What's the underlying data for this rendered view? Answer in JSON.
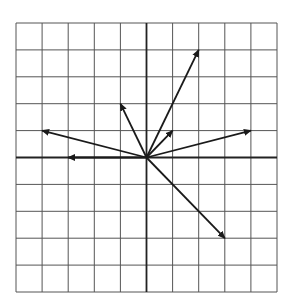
{
  "diagram": {
    "type": "vector-grid",
    "grid": {
      "x_min": -5,
      "x_max": 5,
      "y_min": -5,
      "y_max": 5,
      "step": 1,
      "line_color": "#555555",
      "axis_color": "#222222"
    },
    "origin": [
      0,
      0
    ],
    "vectors": [
      {
        "id": "v1",
        "from": [
          0,
          0
        ],
        "to": [
          2,
          4
        ]
      },
      {
        "id": "v2",
        "from": [
          0,
          0
        ],
        "to": [
          -1,
          2
        ]
      },
      {
        "id": "v3",
        "from": [
          0,
          0
        ],
        "to": [
          1,
          1
        ]
      },
      {
        "id": "v4",
        "from": [
          0,
          0
        ],
        "to": [
          4,
          1
        ]
      },
      {
        "id": "v5",
        "from": [
          0,
          0
        ],
        "to": [
          -4,
          1
        ]
      },
      {
        "id": "v6",
        "from": [
          0,
          0
        ],
        "to": [
          -3,
          0
        ]
      },
      {
        "id": "v7",
        "from": [
          0,
          0
        ],
        "to": [
          3,
          -3
        ]
      }
    ],
    "vector_color": "#1a1a1a"
  }
}
